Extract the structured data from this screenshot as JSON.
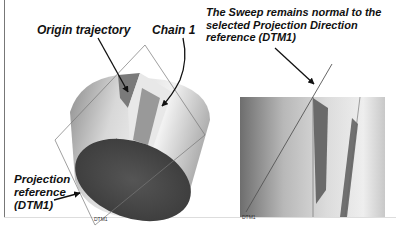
{
  "figure": {
    "callouts": {
      "origin_trajectory": "Origin trajectory",
      "chain_1": "Chain 1",
      "sweep_note": "The Sweep remains normal to the selected Projection Direction reference (DTM1)",
      "projection_reference_line1": "Projection",
      "projection_reference_line2": "reference",
      "projection_reference_line3": "(DTM1)"
    },
    "datum_labels": {
      "left_view": "DTM1",
      "right_view": "DTM1"
    },
    "panels": [
      {
        "name": "isometric-view",
        "description": "Cylinder with swept cut and datum plane DTM1"
      },
      {
        "name": "side-view",
        "description": "Side view showing sweep normal to DTM1 projection plane"
      }
    ],
    "colors": {
      "cylinder_light": "#e6e6e6",
      "cylinder_dark": "#8a8a8a",
      "end_cap": "#4a4a4a",
      "cut_face": "#6f6f6f",
      "arrow": "#111111",
      "datum_line": "#666666"
    }
  }
}
